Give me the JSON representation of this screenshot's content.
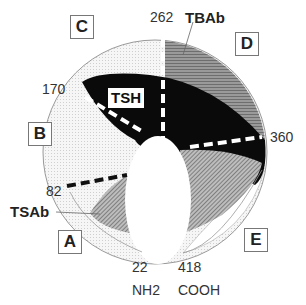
{
  "diagram": {
    "regions": [
      {
        "id": "A",
        "label": "A"
      },
      {
        "id": "B",
        "label": "B"
      },
      {
        "id": "C",
        "label": "C"
      },
      {
        "id": "D",
        "label": "D"
      },
      {
        "id": "E",
        "label": "E"
      }
    ],
    "binding_sites": {
      "tsh": "TSH",
      "tsab": "TSAb",
      "tbab": "TBAb"
    },
    "residues": {
      "r22": "22",
      "r82": "82",
      "r170": "170",
      "r262": "262",
      "r360": "360",
      "r418": "418"
    },
    "termini": {
      "n": "NH2",
      "c": "COOH"
    },
    "colors": {
      "tsh_region": "#0a0a0a",
      "tbab_region": "#8a8a8a",
      "tsab_region": "#9a9a9a",
      "background_stipple": "#ececec",
      "outline": "#888888"
    }
  }
}
